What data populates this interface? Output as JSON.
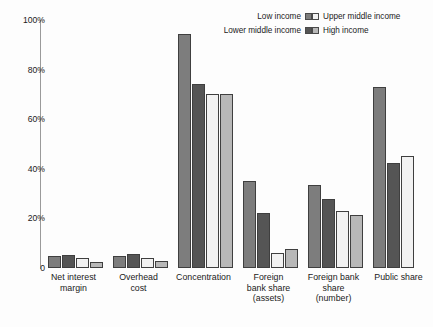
{
  "chart_data": {
    "type": "bar",
    "title": "",
    "xlabel": "",
    "ylabel": "",
    "ylim": [
      0,
      100
    ],
    "grid": false,
    "legend_position": "top-right",
    "y_ticks": [
      "0",
      "20%",
      "40%",
      "60%",
      "80%",
      "100%"
    ],
    "y_tick_values": [
      0,
      20,
      40,
      60,
      80,
      100
    ],
    "categories": [
      "Net interest\nmargin",
      "Overhead\ncost",
      "Concentration",
      "Foreign\nbank share\n(assets)",
      "Foreign bank\nshare\n(number)",
      "Public share"
    ],
    "series": [
      {
        "name": "Low income",
        "color": "#7d7d7d",
        "values": [
          5.0,
          5.0,
          94.5,
          35.0,
          33.5,
          73.0
        ]
      },
      {
        "name": "Lower middle income",
        "color": "#555555",
        "values": [
          5.4,
          5.5,
          74.0,
          22.0,
          28.0,
          42.5
        ]
      },
      {
        "name": "Upper middle income",
        "color": "#f2f2f2",
        "values": [
          4.0,
          4.0,
          70.0,
          6.0,
          23.0,
          45.0
        ]
      },
      {
        "name": "High income",
        "color": "#b8b8b8",
        "values": [
          2.6,
          2.8,
          70.0,
          7.5,
          21.5,
          0
        ]
      }
    ]
  },
  "legend": {
    "entries": [
      {
        "label": "Low income",
        "swatch": "#7d7d7d"
      },
      {
        "label": "Upper middle income",
        "swatch": "#f2f2f2"
      },
      {
        "label": "Lower middle income",
        "swatch": "#555555"
      },
      {
        "label": "High income",
        "swatch": "#b8b8b8"
      }
    ]
  }
}
